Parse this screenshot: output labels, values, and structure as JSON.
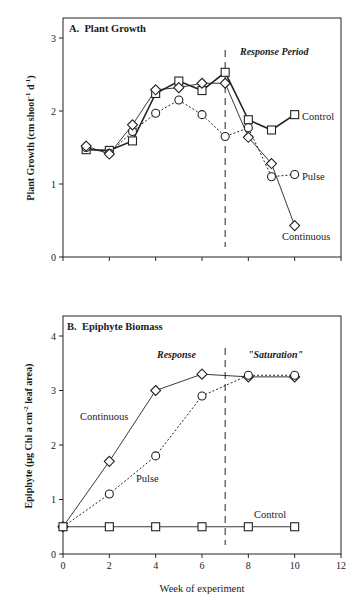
{
  "chart_data": [
    {
      "type": "line",
      "panel": "A",
      "title": "A.  Plant Growth",
      "xlabel": "",
      "ylabel": "Plant Growth (cm shoot⁻¹ d⁻¹)",
      "ylabel_main": "Plant Growth (cm shoot",
      "ylabel_sup1": "-1",
      "ylabel_mid": " d",
      "ylabel_sup2": "-1",
      "ylabel_end": ")",
      "xlim": [
        0,
        12
      ],
      "ylim": [
        0,
        3.3
      ],
      "yticks": [
        0,
        1,
        2,
        3
      ],
      "xticks": [
        0,
        2,
        4,
        6,
        8,
        10,
        12
      ],
      "show_xtick_labels": false,
      "grid": false,
      "annotation": "Response Period",
      "vline_x": 7,
      "x": [
        1,
        2,
        3,
        4,
        5,
        6,
        7,
        8,
        9,
        10
      ],
      "series": [
        {
          "name": "Control",
          "marker": "square",
          "line": "solid-thick",
          "values": [
            1.47,
            1.46,
            1.59,
            2.24,
            2.41,
            2.28,
            2.53,
            1.88,
            1.74,
            1.95
          ]
        },
        {
          "name": "Pulse",
          "marker": "circle",
          "line": "dotted",
          "values": [
            1.5,
            1.42,
            1.72,
            1.97,
            2.15,
            1.95,
            1.65,
            1.77,
            1.1,
            1.13
          ]
        },
        {
          "name": "Continuous",
          "marker": "diamond",
          "line": "solid-thin",
          "values": [
            1.52,
            1.41,
            1.81,
            2.29,
            2.32,
            2.38,
            2.38,
            1.64,
            1.28,
            0.43
          ]
        }
      ],
      "legend_labels": {
        "control": "Control",
        "pulse": "Pulse",
        "continuous": "Continuous"
      }
    },
    {
      "type": "line",
      "panel": "B",
      "title": "B.  Epiphyte Biomass",
      "xlabel": "Week of experiment",
      "ylabel": "Epiphyte (µg Chl a cm⁻² leaf area)",
      "ylabel_main": "Epiphyte (µg Chl a cm",
      "ylabel_sup1": "-2",
      "ylabel_end": " leaf area)",
      "xlim": [
        0,
        12
      ],
      "ylim": [
        0,
        4.35
      ],
      "yticks": [
        0,
        1,
        2,
        3,
        4
      ],
      "xticks": [
        0,
        2,
        4,
        6,
        8,
        10,
        12
      ],
      "show_xtick_labels": true,
      "grid": false,
      "annotations": [
        "Response",
        "\"Saturation\""
      ],
      "vline_x": 7,
      "x": [
        0,
        2,
        4,
        6,
        8,
        10
      ],
      "series": [
        {
          "name": "Continuous",
          "marker": "diamond",
          "line": "solid-thin",
          "values": [
            0.5,
            1.7,
            3.0,
            3.3,
            3.25,
            3.25
          ]
        },
        {
          "name": "Pulse",
          "marker": "circle",
          "line": "dotted",
          "values": [
            0.5,
            1.1,
            1.8,
            2.9,
            3.28,
            3.28
          ]
        },
        {
          "name": "Control",
          "marker": "square",
          "line": "solid-thin",
          "values": [
            0.5,
            0.5,
            0.5,
            0.5,
            0.5,
            0.5
          ]
        }
      ],
      "legend_labels": {
        "control": "Control",
        "pulse": "Pulse",
        "continuous": "Continuous"
      }
    }
  ]
}
